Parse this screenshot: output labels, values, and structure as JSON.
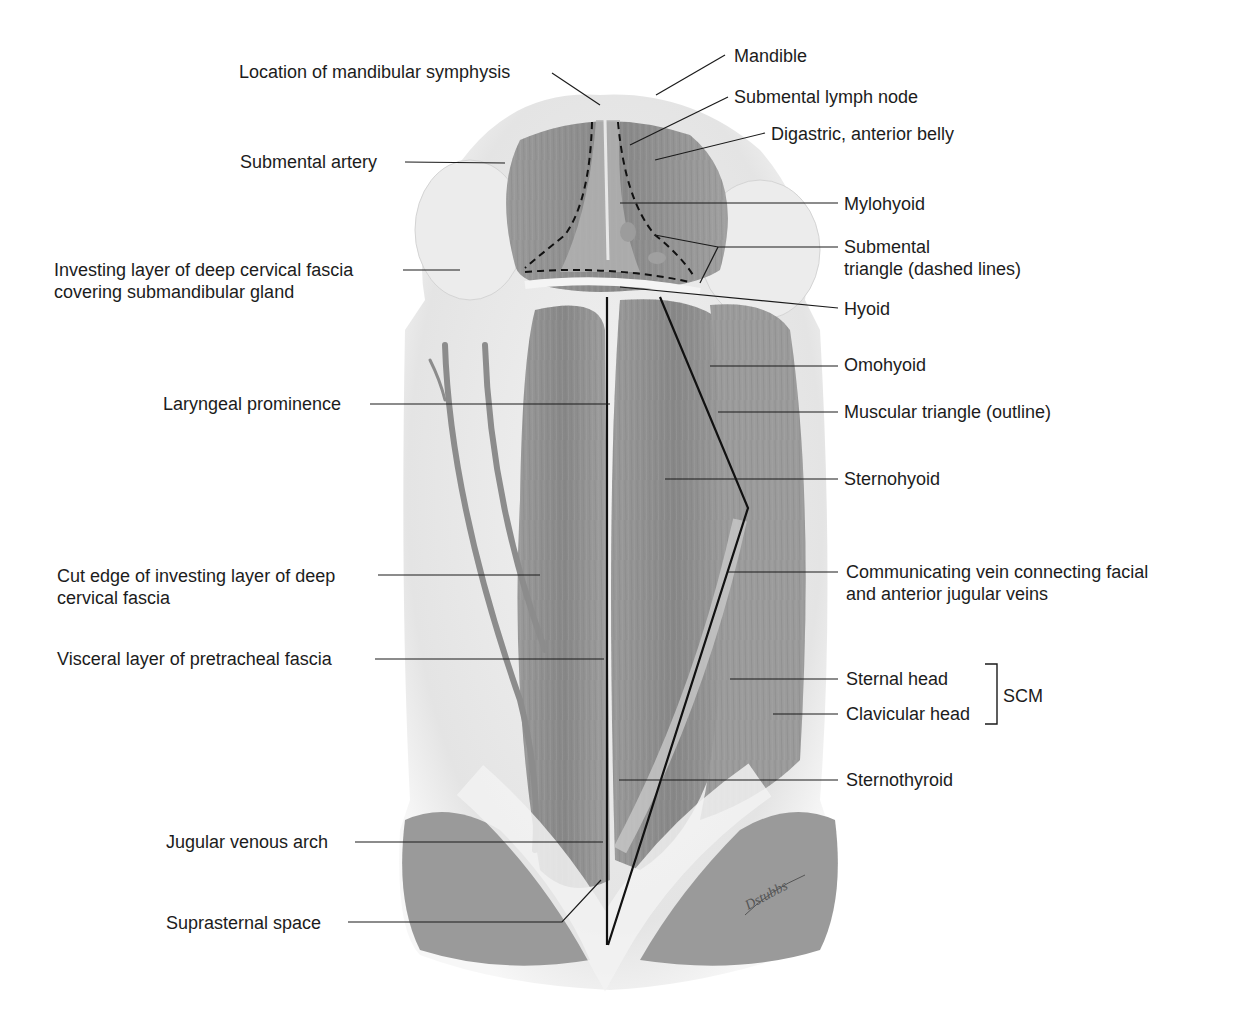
{
  "figure": {
    "artist_signature": "Dstubbs"
  },
  "labels_left": {
    "mandibular_symphysis": "Location of mandibular symphysis",
    "submental_artery": "Submental artery",
    "investing_layer_1": "Investing layer of deep cervical fascia",
    "investing_layer_2": "covering submandibular gland",
    "laryngeal_prominence": "Laryngeal prominence",
    "cut_edge_1": "Cut edge of investing layer of deep",
    "cut_edge_2": "cervical fascia",
    "visceral_layer": "Visceral layer of pretracheal fascia",
    "jugular_arch": "Jugular venous arch",
    "suprasternal_space": "Suprasternal space"
  },
  "labels_right": {
    "mandible": "Mandible",
    "submental_lymph_node": "Submental lymph node",
    "digastric": "Digastric, anterior belly",
    "mylohyoid": "Mylohyoid",
    "submental_triangle_1": "Submental",
    "submental_triangle_2": "triangle (dashed lines)",
    "hyoid": "Hyoid",
    "omohyoid": "Omohyoid",
    "muscular_triangle": "Muscular triangle (outline)",
    "sternohyoid": "Sternohyoid",
    "communicating_vein_1": "Communicating vein connecting facial",
    "communicating_vein_2": "and anterior jugular veins",
    "sternal_head": "Sternal head",
    "clavicular_head": "Clavicular head",
    "scm": "SCM",
    "sternothyroid": "Sternothyroid"
  },
  "colors": {
    "background": "#ffffff",
    "skin_fascia": "#e9e9e9",
    "muscle_dark": "#8a8a8a",
    "muscle_mid": "#a3a3a3",
    "leader_line": "#1a1a1a"
  }
}
